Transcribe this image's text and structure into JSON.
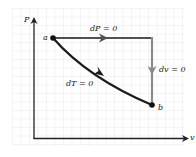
{
  "diagram": {
    "type": "P-v thermodynamic process diagram",
    "axes": {
      "y_label": "P",
      "x_label": "v"
    },
    "points": [
      {
        "id": "a",
        "label": "a"
      },
      {
        "id": "b",
        "label": "b"
      }
    ],
    "paths": [
      {
        "id": "isobaric",
        "label": "dP = 0",
        "color": "#505050"
      },
      {
        "id": "isochoric",
        "label": "dv = 0",
        "color": "#8a8a8a"
      },
      {
        "id": "isothermal",
        "label": "dT = 0",
        "color": "#1a1a1a"
      }
    ],
    "colors": {
      "grid": "#e6e6e6",
      "axis": "#222222",
      "background": "#ffffff"
    }
  }
}
